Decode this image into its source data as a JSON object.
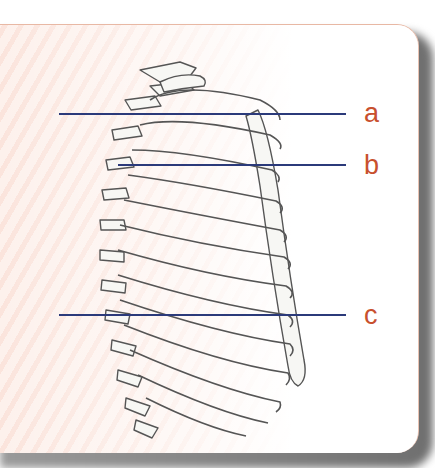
{
  "figure": {
    "type": "anatomical-diagram",
    "labels": [
      {
        "id": "a",
        "text": "a",
        "line_y": 114
      },
      {
        "id": "b",
        "text": "b",
        "line_y": 165
      },
      {
        "id": "c",
        "text": "c",
        "line_y": 315
      }
    ],
    "colors": {
      "leader_line": "#2b3a7a",
      "label_text": "#c8502e",
      "panel_stripe_a": "#fdf1ec",
      "panel_stripe_b": "#fbe4dc",
      "bone_outline": "#555555",
      "bone_fill": "#f7f7f4",
      "shadow": "#7a7a7a"
    }
  }
}
